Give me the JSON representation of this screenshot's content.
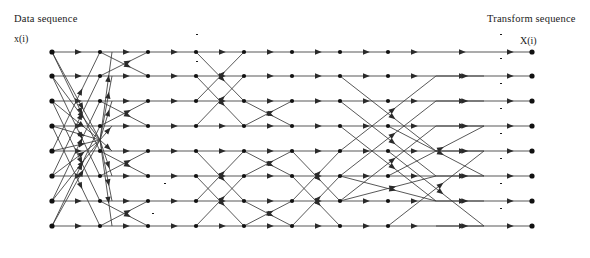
{
  "figure": {
    "type": "signal-flow-graph",
    "title_left": "Data sequence",
    "title_right": "Transform sequence",
    "input_var": "x(i)",
    "output_var": "X(i)",
    "input_indices": [
      "0",
      "1",
      "2",
      "3",
      "4",
      "5",
      "6",
      "7"
    ],
    "output_indices": [
      "0",
      "1",
      "2",
      "3",
      "4",
      "5",
      "6",
      "7"
    ],
    "stage_columns_x": [
      52,
      100,
      148,
      196,
      244,
      292,
      340,
      388,
      436,
      484,
      532
    ],
    "row_y": [
      52,
      76,
      101,
      126,
      151,
      176,
      201,
      226
    ],
    "colors": {
      "line": "#3a3a3a",
      "text": "#1a1a1a",
      "background": "#ffffff"
    },
    "labels": [
      {
        "id": "m1",
        "text": "1/sqrt2",
        "kind": "frac",
        "num": "1",
        "den": "√2",
        "x": 196,
        "y": 34
      },
      {
        "id": "m2",
        "text": "1/sqrt2",
        "kind": "frac",
        "num": "1",
        "den": "√2",
        "x": 196,
        "y": 61
      },
      {
        "id": "m3",
        "text": "-1",
        "kind": "plain",
        "x": 268,
        "y": 77
      },
      {
        "id": "m4",
        "text": "-1",
        "kind": "plain",
        "x": 140,
        "y": 103
      },
      {
        "id": "m5",
        "text": "-C1_8",
        "kind": "cs",
        "sign": "-",
        "letter": "C",
        "sup": "1",
        "sub": "8",
        "x": 186,
        "y": 89
      },
      {
        "id": "m6",
        "text": "S1_8",
        "kind": "cs",
        "sign": "",
        "letter": "S",
        "sup": "1",
        "sub": "8",
        "x": 174,
        "y": 110
      },
      {
        "id": "m7",
        "text": "S1_8",
        "kind": "cs",
        "sign": "",
        "letter": "S",
        "sup": "1",
        "sub": "8",
        "x": 218,
        "y": 110
      },
      {
        "id": "m8",
        "text": "C1_8",
        "kind": "cs",
        "sign": "",
        "letter": "C",
        "sup": "1",
        "sub": "8",
        "x": 186,
        "y": 118
      },
      {
        "id": "m9",
        "text": "-1",
        "kind": "plain",
        "x": 140,
        "y": 128
      },
      {
        "id": "m10",
        "text": "1/sqrt2",
        "kind": "frac",
        "num": "1",
        "den": "√2",
        "x": 164,
        "y": 183
      },
      {
        "id": "m11",
        "text": "1/sqrt2",
        "kind": "frac",
        "num": "1",
        "den": "√2",
        "x": 152,
        "y": 213
      },
      {
        "id": "m12",
        "text": "-1",
        "kind": "plain",
        "x": 205,
        "y": 228
      },
      {
        "id": "m13",
        "text": "C1_16",
        "kind": "cs",
        "sign": "",
        "letter": "C",
        "sup": "1",
        "sub": "16",
        "x": 318,
        "y": 142
      },
      {
        "id": "m14",
        "text": "S1_16",
        "kind": "cs",
        "sign": "",
        "letter": "S",
        "sup": "1",
        "sub": "16",
        "x": 298,
        "y": 163
      },
      {
        "id": "m15",
        "text": "S1_16",
        "kind": "cs",
        "sign": "",
        "letter": "S",
        "sup": "1",
        "sub": "16",
        "x": 348,
        "y": 163
      },
      {
        "id": "m16",
        "text": "-C1_16",
        "kind": "cs",
        "sign": "-",
        "letter": "C",
        "sup": "1",
        "sub": "16",
        "x": 318,
        "y": 177
      },
      {
        "id": "m17",
        "text": "C3_16",
        "kind": "cs",
        "sign": "",
        "letter": "C",
        "sup": "3",
        "sub": "16",
        "x": 318,
        "y": 196
      },
      {
        "id": "m18",
        "text": "-1",
        "kind": "plain",
        "x": 272,
        "y": 205
      },
      {
        "id": "m19",
        "text": "S3_16",
        "kind": "cs",
        "sign": "",
        "letter": "S",
        "sup": "3",
        "sub": "16",
        "x": 298,
        "y": 216
      },
      {
        "id": "m20",
        "text": "S3_16",
        "kind": "cs",
        "sign": "",
        "letter": "S",
        "sup": "3",
        "sub": "16",
        "x": 362,
        "y": 216
      },
      {
        "id": "m21",
        "text": "-C3_16",
        "kind": "cs",
        "sign": "-",
        "letter": "C",
        "sup": "3",
        "sub": "16",
        "x": 312,
        "y": 235
      }
    ],
    "output_multipliers": [
      {
        "row": 0,
        "num": "1",
        "den": "2"
      },
      {
        "row": 1,
        "num": "1",
        "den": "2"
      },
      {
        "row": 2,
        "num": "1",
        "den": "2"
      },
      {
        "row": 3,
        "num": "1",
        "den": "2"
      },
      {
        "row": 4,
        "num": "1",
        "den": "2"
      },
      {
        "row": 5,
        "num": "1",
        "den": "2"
      },
      {
        "row": 6,
        "num": "1",
        "den": "2"
      },
      {
        "row": 7,
        "num": "1",
        "den": "2"
      }
    ]
  }
}
